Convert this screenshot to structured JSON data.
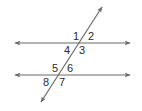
{
  "diagram": {
    "type": "parallel-lines-cut-by-transversal",
    "line_color": "#6b6b6b",
    "label_color": "#2b2b2b",
    "lines": [
      {
        "name": "upper-parallel-line",
        "x1": 15,
        "y1": 43,
        "x2": 130,
        "y2": 43,
        "arrows": "both"
      },
      {
        "name": "lower-parallel-line",
        "x1": 15,
        "y1": 75,
        "x2": 130,
        "y2": 75,
        "arrows": "both"
      },
      {
        "name": "transversal",
        "x1": 41,
        "y1": 102,
        "x2": 102,
        "y2": 7,
        "arrows": "both"
      }
    ],
    "angles": [
      {
        "id": "1",
        "label": "1",
        "x": 73,
        "y": 40
      },
      {
        "id": "2",
        "label": "2",
        "x": 88,
        "y": 40
      },
      {
        "id": "3",
        "label": "3",
        "x": 79,
        "y": 54
      },
      {
        "id": "4",
        "label": "4",
        "x": 64,
        "y": 54
      },
      {
        "id": "5",
        "label": "5",
        "x": 52,
        "y": 72
      },
      {
        "id": "6",
        "label": "6",
        "x": 67,
        "y": 72
      },
      {
        "id": "7",
        "label": "7",
        "x": 59,
        "y": 86
      },
      {
        "id": "8",
        "label": "8",
        "x": 43,
        "y": 86
      }
    ]
  }
}
